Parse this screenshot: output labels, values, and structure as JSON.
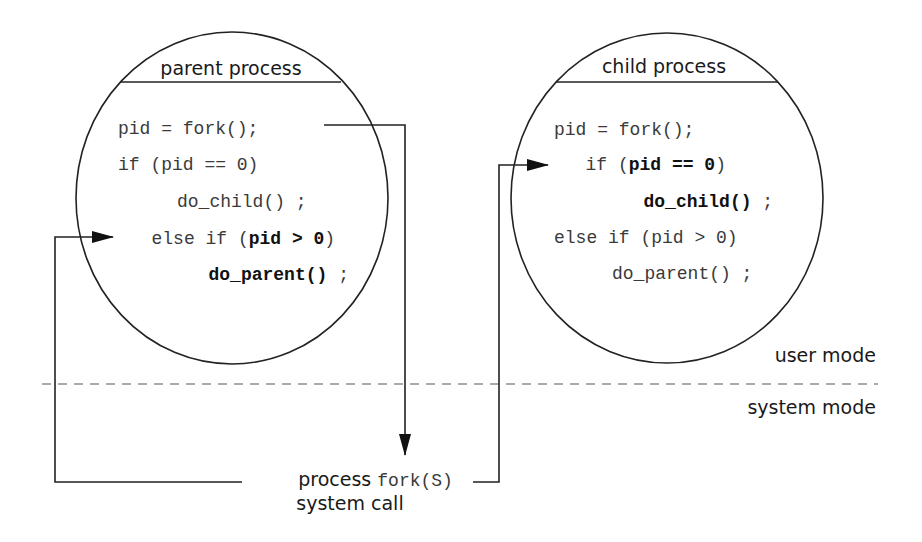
{
  "diagram": {
    "type": "process-fork-flow",
    "colors": {
      "stroke": "#222222",
      "text": "#1a1a1a",
      "code": "#3a3a3a",
      "dashed": "#555555",
      "background": "#ffffff"
    },
    "parent": {
      "title": "parent process",
      "code": {
        "line1": "pid = fork();",
        "line2": "if (pid == 0)",
        "line3": "do_child() ;",
        "line4_prefix": "else if (",
        "line4_bold": "pid > 0",
        "line4_suffix": ")",
        "line5": "do_parent()",
        "line5_suffix": " ;"
      },
      "highlighted": [
        "pid > 0",
        "do_parent()"
      ]
    },
    "child": {
      "title": "child process",
      "code": {
        "line1": "pid = fork();",
        "line2_prefix": "if (",
        "line2_bold": "pid == 0",
        "line2_suffix": ")",
        "line3": "do_child()",
        "line3_suffix": " ;",
        "line4": "else if (pid > 0)",
        "line5": "do_parent() ;"
      },
      "highlighted": [
        "pid == 0",
        "do_child()"
      ]
    },
    "modes": {
      "user": "user mode",
      "system": "system mode"
    },
    "syscall": {
      "label_prefix": "process ",
      "label_code": "fork(S)",
      "label_line2": "system call"
    },
    "edges": [
      {
        "from": "parent.pid = fork();",
        "to": "syscall",
        "direction": "down"
      },
      {
        "from": "syscall",
        "to": "parent.else if (pid > 0)"
      },
      {
        "from": "syscall",
        "to": "child.if (pid == 0)"
      }
    ]
  }
}
